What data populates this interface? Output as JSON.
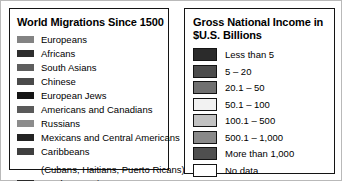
{
  "panels": {
    "migrations": {
      "title": "World Migrations Since 1500",
      "items": [
        {
          "label": "Europeans",
          "color": "#838383"
        },
        {
          "label": "Africans",
          "color": "#2e2e2e"
        },
        {
          "label": "South Asians",
          "color": "#5e5e5e"
        },
        {
          "label": "Chinese",
          "color": "#4a4a4a"
        },
        {
          "label": "European Jews",
          "color": "#151515"
        },
        {
          "label": "Americans and Canadians",
          "color": "#5a5a5a"
        },
        {
          "label": "Russians",
          "color": "#8c8c8c"
        },
        {
          "label": "Mexicans and Central Americans",
          "color": "#232323"
        },
        {
          "label": "Caribbeans",
          "color": "#3f3f3f",
          "sublabel": "(Cubans, Haitians, Puerto Ricans)"
        },
        {
          "label": "Southeast Asians",
          "color": "#2a2a2a"
        }
      ]
    },
    "gni": {
      "title": "Gross National Income in $U.S. Billions",
      "items": [
        {
          "label": "Less than 5",
          "color": "#2b2b2b"
        },
        {
          "label": "5 – 20",
          "color": "#4c4c4c"
        },
        {
          "label": "20.1 – 50",
          "color": "#707070"
        },
        {
          "label": "50.1 – 100",
          "color": "#f2f2f2"
        },
        {
          "label": "100.1 – 500",
          "color": "#c2c2c2"
        },
        {
          "label": "500.1 – 1,000",
          "color": "#898989"
        },
        {
          "label": "More than 1,000",
          "color": "#4f4f4f"
        },
        {
          "label": "No data",
          "color": "#ffffff"
        }
      ]
    }
  },
  "colors": {
    "frame": "#b9b9b9",
    "panel_border": "#141414",
    "text": "#000000",
    "background": "#ffffff"
  }
}
